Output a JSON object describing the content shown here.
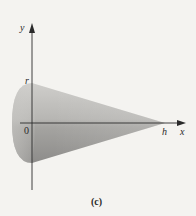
{
  "figure": {
    "caption": "(c)",
    "axes": {
      "x_label": "x",
      "y_label": "y",
      "origin_label": "0"
    },
    "annotations": {
      "radius_label": "r",
      "height_label": "h"
    },
    "colors": {
      "background": "#f4f3f0",
      "axis": "#2a2a2a",
      "cone_light": "#d4d3d0",
      "cone_dark": "#8f8e8c"
    }
  }
}
